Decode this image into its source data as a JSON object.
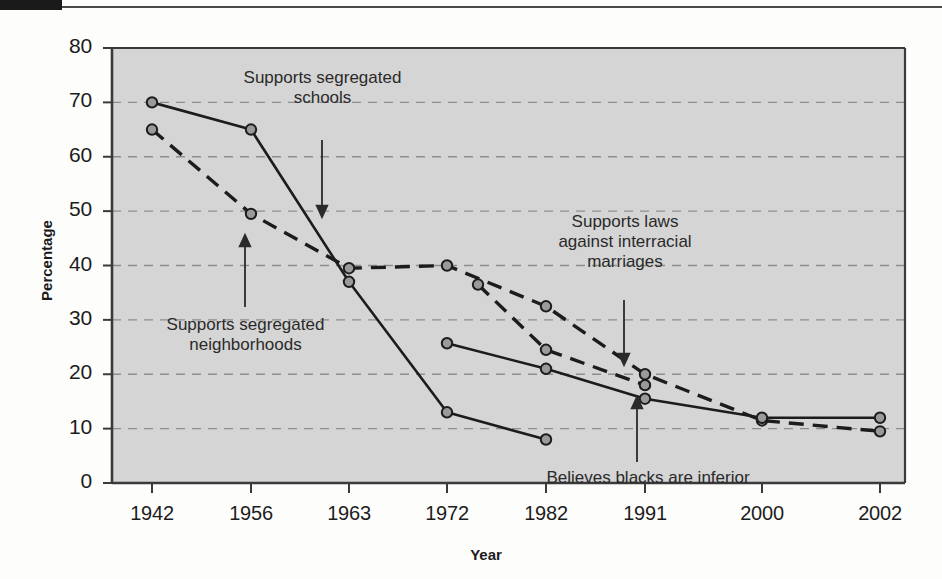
{
  "figure": {
    "background_color": "#fdfdfc",
    "plot_background_color": "#d5d5d5",
    "line_color": "#1c1c1c",
    "marker_fill_color": "#9a9a9a",
    "gridline_color": "#8e8e8e"
  },
  "axes": {
    "ylabel": "Percentage",
    "xlabel": "Year",
    "ytick_labels": [
      "0",
      "10",
      "20",
      "30",
      "40",
      "50",
      "60",
      "70",
      "80"
    ],
    "xtick_labels": [
      "1942",
      "1956",
      "1963",
      "1972",
      "1982",
      "1991",
      "2000",
      "2002"
    ]
  },
  "annotations": [
    {
      "name": "supports-segregated-schools",
      "text": "Supports segregated\nschools"
    },
    {
      "name": "supports-segregated-neighborhoods",
      "text": "Supports segregated\nneighborhoods"
    },
    {
      "name": "supports-laws-against-interracial-marriages",
      "text": "Supports laws\nagainst interracial\nmarriages"
    },
    {
      "name": "believes-blacks-are-inferior",
      "text": "Believes blacks are inferior"
    }
  ],
  "chart_data": {
    "type": "line",
    "title": "",
    "xlabel": "Year",
    "ylabel": "Percentage",
    "ylim": [
      0,
      80
    ],
    "ytick_step": 10,
    "grid": true,
    "legend": "inline-annotations",
    "x_categories": [
      "1942",
      "1956",
      "1963",
      "1972",
      "1982",
      "1991",
      "2000",
      "2002"
    ],
    "series": [
      {
        "name": "Supports segregated schools",
        "style": "solid",
        "points": [
          {
            "x": "1942",
            "y": 70
          },
          {
            "x": "1956",
            "y": 65
          },
          {
            "x": "1963",
            "y": 37
          },
          {
            "x": "1972",
            "y": 13
          },
          {
            "x": "1982",
            "y": 8
          }
        ]
      },
      {
        "name": "Supports segregated neighborhoods",
        "style": "dashed",
        "points": [
          {
            "x": "1942",
            "y": 65
          },
          {
            "x": "1956",
            "y": 49.5
          },
          {
            "x": "1963",
            "y": 39.5
          },
          {
            "x": "1972",
            "y": 40
          },
          {
            "x": "1982",
            "y": 32.5
          },
          {
            "x": "1991",
            "y": 20
          },
          {
            "x": "2000",
            "y": 11.5
          },
          {
            "x": "2002",
            "y": 9.5
          }
        ]
      },
      {
        "name": "Supports laws against interracial marriages",
        "style": "dashed",
        "points": [
          {
            "x": "1973",
            "y": 36.5
          },
          {
            "x": "1982",
            "y": 24.5
          },
          {
            "x": "1991",
            "y": 18
          }
        ]
      },
      {
        "name": "Believes blacks are inferior",
        "style": "solid",
        "points": [
          {
            "x": "1972",
            "y": 25.7
          },
          {
            "x": "1982",
            "y": 21
          },
          {
            "x": "1991",
            "y": 15.5
          },
          {
            "x": "2000",
            "y": 12
          },
          {
            "x": "2002",
            "y": 12
          }
        ]
      }
    ]
  }
}
